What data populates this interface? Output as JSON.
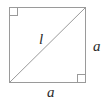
{
  "figure": {
    "shape": "square",
    "background_color": "#ffffff",
    "stroke_color": "#9a9a9a",
    "label_color": "#2b2b2b",
    "stroke_width": 1,
    "square": {
      "x": 9,
      "y": 7,
      "width": 77,
      "height": 76
    },
    "diagonal": {
      "from": [
        9,
        83
      ],
      "to": [
        86,
        7
      ],
      "label": "l"
    },
    "right_angle_markers": [
      {
        "corner": "top-left",
        "x": 9,
        "y": 7,
        "size": 8
      },
      {
        "corner": "bottom-right",
        "x": 86,
        "y": 83,
        "size": 8
      }
    ],
    "labels": {
      "diagonal": "l",
      "side_right": "a",
      "side_bottom": "a"
    }
  }
}
